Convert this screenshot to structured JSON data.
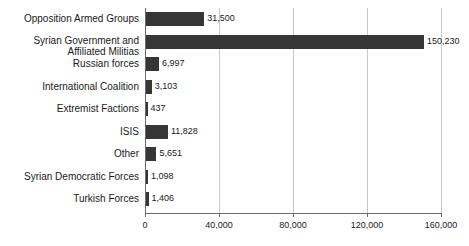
{
  "chart_data": {
    "type": "bar",
    "orientation": "horizontal",
    "title": "",
    "subtitle": "",
    "xlabel": "",
    "ylabel": "",
    "xlim": [
      0,
      160000
    ],
    "grid": true,
    "grid_axis": "x",
    "legend": false,
    "bar_color": "#363636",
    "gridline_color": "#c8c8c8",
    "axis_color": "#6b6b6b",
    "text_color": "#1a1a1a",
    "xticks": [
      0,
      40000,
      80000,
      120000,
      160000
    ],
    "xtick_labels": [
      "0",
      "40,000",
      "80,000",
      "120,000",
      "160,000"
    ],
    "categories": [
      "Opposition Armed Groups",
      "Syrian Government and\nAffiliated Militias",
      "Russian forces",
      "International Coalition",
      "Extremist Factions",
      "ISIS",
      "Other",
      "Syrian Democratic Forces",
      "Turkish Forces"
    ],
    "values": [
      31500,
      150230,
      6997,
      3103,
      437,
      11828,
      5651,
      1098,
      1406
    ],
    "value_labels": [
      "31,500",
      "150,230",
      "6,997",
      "3,103",
      "437",
      "11,828",
      "5,651",
      "1,098",
      "1,406"
    ]
  }
}
